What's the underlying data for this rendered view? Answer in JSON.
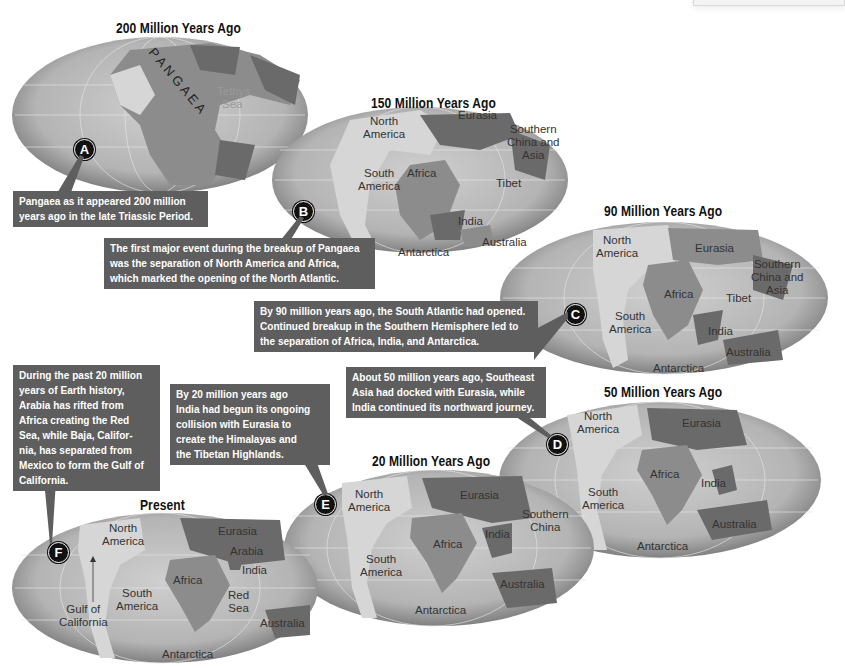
{
  "figure": {
    "type": "plate-tectonics-timeline",
    "colors": {
      "ocean": "#bdbdbd",
      "ocean_edge": "#6f6f6f",
      "land_light": "#d6d6d6",
      "land_mid": "#8c8c8c",
      "land_dark": "#6a6a6a",
      "callout_bg": "#5e5e5e",
      "callout_text": "#ffffff",
      "marker_bg": "#111111"
    },
    "maps": [
      {
        "id": "200mya",
        "title": "200 Million Years Ago",
        "marker": "A",
        "labels": {
          "pangaea": "P A N G A E A",
          "tethys": "Tethys",
          "sea": "Sea"
        },
        "callout": [
          "Pangaea as it appeared 200 million",
          "years ago in the late Triassic Period."
        ]
      },
      {
        "id": "150mya",
        "title": "150 Million Years Ago",
        "marker": "B",
        "labels": {
          "north": "North",
          "america": "America",
          "eurasia": "Eurasia",
          "southern": "Southern",
          "china_and": "China and",
          "asia": "Asia",
          "south": "South",
          "s_america": "America",
          "africa": "Africa",
          "tibet": "Tibet",
          "india": "India",
          "australia": "Australia",
          "antarctica": "Antarctica"
        },
        "callout": [
          "The first major event during the breakup of Pangaea",
          "was the separation of North America and Africa,",
          "which marked the opening of the North Atlantic."
        ]
      },
      {
        "id": "90mya",
        "title": "90 Million Years Ago",
        "marker": "C",
        "labels": {
          "north": "North",
          "america": "America",
          "eurasia": "Eurasia",
          "southern": "Southern",
          "china_and": "China and",
          "asia": "Asia",
          "africa": "Africa",
          "tibet": "Tibet",
          "south": "South",
          "s_america": "America",
          "india": "India",
          "australia": "Australia",
          "antarctica": "Antarctica"
        },
        "callout": [
          "By 90 million years ago, the South Atlantic had opened.",
          "Continued breakup in the Southern Hemisphere led to",
          "the separation of Africa, India, and Antarctica."
        ]
      },
      {
        "id": "50mya",
        "title": "50 Million Years Ago",
        "marker": "D",
        "labels": {
          "north": "North",
          "america": "America",
          "eurasia": "Eurasia",
          "africa": "Africa",
          "india": "India",
          "south": "South",
          "s_america": "America",
          "australia": "Australia",
          "antarctica": "Antarctica"
        },
        "callout": [
          "About 50 million years ago, Southeast",
          "Asia had docked with Eurasia, while",
          "India continued its northward journey."
        ]
      },
      {
        "id": "20mya",
        "title": "20 Million Years Ago",
        "marker": "E",
        "labels": {
          "north": "North",
          "america": "America",
          "eurasia": "Eurasia",
          "southern": "Southern",
          "china": "China",
          "india": "India",
          "africa": "Africa",
          "south": "South",
          "s_america": "America",
          "australia": "Australia",
          "antarctica": "Antarctica"
        },
        "callout": [
          "By 20 million years ago",
          "India had begun its ongoing",
          "collision with Eurasia to",
          "create the Himalayas and",
          "the Tibetan Highlands."
        ]
      },
      {
        "id": "present",
        "title": "Present",
        "marker": "F",
        "labels": {
          "north": "North",
          "america": "America",
          "eurasia": "Eurasia",
          "arabia": "Arabia",
          "india": "India",
          "africa": "Africa",
          "south": "South",
          "s_america": "America",
          "red": "Red",
          "sea": "Sea",
          "gulf_of": "Gulf of",
          "california": "California",
          "australia": "Australia",
          "antarctica": "Antarctica"
        },
        "callout": [
          "During the past 20 million",
          "years of Earth history,",
          "Arabia has rifted from",
          "Africa creating the Red",
          "Sea, while Baja, Califor-",
          "nia, has separated from",
          "Mexico to form the Gulf of",
          "California."
        ]
      }
    ]
  }
}
